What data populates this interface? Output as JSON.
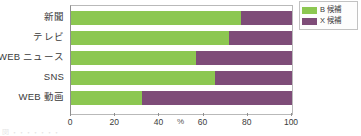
{
  "chart_data": {
    "type": "bar",
    "orientation": "horizontal",
    "stacked": true,
    "stacked_percent": true,
    "title": "",
    "subtitle": "",
    "xlabel": "%",
    "ylabel": "",
    "xlim": [
      0,
      100
    ],
    "xticks": [
      0,
      20,
      40,
      60,
      80,
      100
    ],
    "xtick_labels": [
      "0",
      "20",
      "40",
      "60",
      "80",
      "100"
    ],
    "unit_label": "%",
    "grid": false,
    "legend_position": "top-right",
    "categories": [
      "新聞",
      "テレビ",
      "WEB ニュース",
      "SNS",
      "WEB 動画"
    ],
    "series": [
      {
        "name": "B 候補",
        "color": "#8CC751",
        "values": [
          77,
          71.5,
          56.5,
          65,
          32
        ]
      },
      {
        "name": "X 候補",
        "color": "#7E4C78",
        "values": [
          23,
          28.5,
          43.5,
          35,
          68
        ]
      }
    ]
  },
  "legend": {
    "entries": [
      {
        "label": "B 候補",
        "color": "#8CC751"
      },
      {
        "label": "X 候補",
        "color": "#7E4C78"
      }
    ]
  },
  "axis": {
    "unit": "%",
    "ticks": [
      "0",
      "20",
      "40",
      "60",
      "80",
      "100"
    ]
  },
  "caption": {
    "fragment": "図 ・・・・・・・"
  },
  "colors": {
    "series_b": "#8CC751",
    "series_x": "#7E4C78",
    "axis_line": "#8f8f8f",
    "plot_border": "#b9b9b9",
    "text": "#3b3b3b"
  }
}
